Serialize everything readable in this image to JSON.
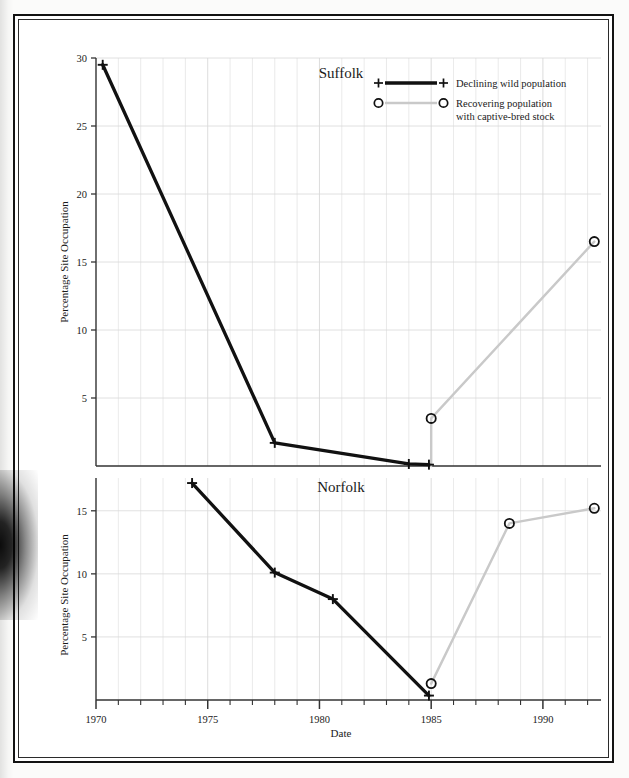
{
  "figure": {
    "axis_x_label": "Date",
    "axis_y_label_top": "Percentage Site Occupation",
    "axis_y_label_bottom": "Percentage Site Occupation",
    "panel_title_top": "Suffolk",
    "panel_title_bottom": "Norfolk",
    "colors": {
      "declining_line": "#111111",
      "recovering_line": "#c9c9c9",
      "grid": "#d8d8d8",
      "axis": "#333333",
      "frame": "#121212",
      "background": "#ffffff"
    }
  },
  "legend": {
    "position": "top-right",
    "items": [
      {
        "label": "Declining wild population",
        "marker": "plus-marker",
        "line_color": "#111111"
      },
      {
        "label": "Recovering population\nwith captive-bred stock",
        "label_line1": "Recovering population",
        "label_line2": "with captive-bred stock",
        "marker": "circle-marker",
        "line_color": "#c9c9c9"
      }
    ]
  },
  "chart_data": [
    {
      "type": "line",
      "title": "Suffolk",
      "xlabel": "Date",
      "ylabel": "Percentage Site Occupation",
      "xlim": [
        1970,
        1992.6
      ],
      "ylim": [
        0,
        30
      ],
      "yticks": [
        5,
        10,
        15,
        20,
        25,
        30
      ],
      "xticks": [
        1970,
        1975,
        1980,
        1985,
        1990
      ],
      "xtick_labels": [
        "1970",
        "1975",
        "1980",
        "1990"
      ],
      "xtick_minor_step": 1,
      "grid": true,
      "legend": "top-right",
      "series": [
        {
          "name": "Declining wild population",
          "marker": "plus",
          "color": "#111111",
          "x": [
            1970.3,
            1978.0,
            1984.0,
            1984.9
          ],
          "y": [
            29.5,
            1.7,
            0.15,
            0.1
          ]
        },
        {
          "name": "Recovering population with captive-bred stock",
          "marker": "circle",
          "color": "#c9c9c9",
          "x": [
            1985.0,
            1985.0,
            1992.3
          ],
          "y": [
            0.0,
            3.5,
            16.5
          ]
        }
      ]
    },
    {
      "type": "line",
      "title": "Norfolk",
      "xlabel": "Date",
      "ylabel": "Percentage Site Occupation",
      "xlim": [
        1970,
        1992.6
      ],
      "ylim": [
        0,
        17.6
      ],
      "yticks": [
        5,
        10,
        15
      ],
      "xticks": [
        1970,
        1975,
        1980,
        1985,
        1990
      ],
      "xtick_labels": [
        "1970",
        "1975",
        "1980",
        "1985",
        "1990"
      ],
      "xtick_minor_step": 1,
      "grid": true,
      "series": [
        {
          "name": "Declining wild population",
          "marker": "plus",
          "color": "#111111",
          "x": [
            1974.3,
            1978.0,
            1980.6,
            1984.9
          ],
          "y": [
            17.2,
            10.1,
            8.0,
            0.35
          ]
        },
        {
          "name": "Recovering population with captive-bred stock",
          "marker": "circle",
          "color": "#c9c9c9",
          "x": [
            1985.0,
            1988.5,
            1992.3
          ],
          "y": [
            1.3,
            14.0,
            15.2
          ]
        }
      ]
    }
  ]
}
